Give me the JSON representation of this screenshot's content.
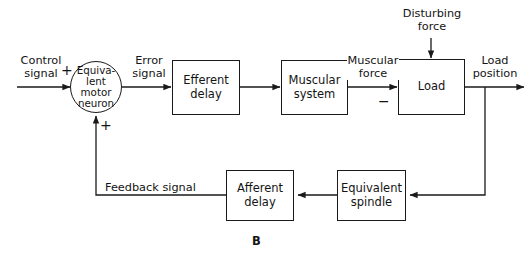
{
  "figure": {
    "label": "B",
    "caption_position": "bottom-center",
    "type": "block-diagram"
  },
  "colors": {
    "background": "#ffffff",
    "stroke": "#1a1a1a",
    "text": "#141414"
  },
  "blocks": [
    {
      "id": "equivalent-motor-neuron",
      "label": "Equiva-\nlent\nmotor\nneuron",
      "shape": "circle"
    },
    {
      "id": "efferent-delay",
      "label": "Efferent\ndelay",
      "shape": "rect"
    },
    {
      "id": "muscular-system",
      "label": "Muscular\nsystem",
      "shape": "rect"
    },
    {
      "id": "load",
      "label": "Load",
      "shape": "rect"
    },
    {
      "id": "afferent-delay",
      "label": "Afferent\ndelay",
      "shape": "rect"
    },
    {
      "id": "equivalent-spindle",
      "label": "Equivalent\nspindle",
      "shape": "rect"
    }
  ],
  "signals": {
    "control": "Control\nsignal",
    "error": "Error\nsignal",
    "muscular_force": "Muscular\nforce",
    "disturbing_force": "Disturbing\nforce",
    "load_position": "Load\nposition",
    "feedback": "Feedback signal"
  },
  "signs": {
    "control_into_sum": "+",
    "feedback_into_sum": "+",
    "disturbance_into_load": "−"
  }
}
